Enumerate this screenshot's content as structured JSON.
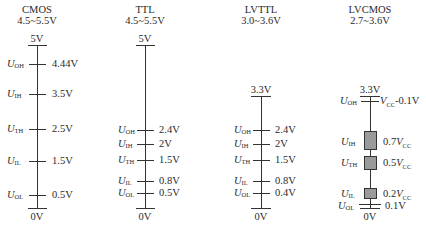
{
  "diagram": {
    "type": "logic-level-comparison",
    "columns": [
      {
        "name": "CMOS",
        "range": "4.5~5.5V",
        "top_label": "5V",
        "bottom_label": "0V",
        "levels": [
          {
            "symbol": "U",
            "sub": "OH",
            "value": "4.44V"
          },
          {
            "symbol": "U",
            "sub": "IH",
            "value": "3.5V"
          },
          {
            "symbol": "U",
            "sub": "TH",
            "value": "2.5V"
          },
          {
            "symbol": "U",
            "sub": "IL",
            "value": "1.5V"
          },
          {
            "symbol": "U",
            "sub": "OL",
            "value": "0.5V"
          }
        ]
      },
      {
        "name": "TTL",
        "range": "4.5~5.5V",
        "top_label": "5V",
        "bottom_label": "0V",
        "levels": [
          {
            "symbol": "U",
            "sub": "OH",
            "value": "2.4V"
          },
          {
            "symbol": "U",
            "sub": "IH",
            "value": "2V"
          },
          {
            "symbol": "U",
            "sub": "TH",
            "value": "1.5V"
          },
          {
            "symbol": "U",
            "sub": "IL",
            "value": "0.8V"
          },
          {
            "symbol": "U",
            "sub": "OL",
            "value": "0.5V"
          }
        ]
      },
      {
        "name": "LVTTL",
        "range": "3.0~3.6V",
        "top_label": "3.3V",
        "bottom_label": "0V",
        "levels": [
          {
            "symbol": "U",
            "sub": "OH",
            "value": "2.4V"
          },
          {
            "symbol": "U",
            "sub": "IH",
            "value": "2V"
          },
          {
            "symbol": "U",
            "sub": "TH",
            "value": "1.5V"
          },
          {
            "symbol": "U",
            "sub": "IL",
            "value": "0.8V"
          },
          {
            "symbol": "U",
            "sub": "OL",
            "value": "0.4V"
          }
        ]
      },
      {
        "name": "LVCMOS",
        "range": "2.7~3.6V",
        "top_label": "3.3V",
        "bottom_label": "0V",
        "levels": [
          {
            "symbol": "U",
            "sub": "OH",
            "value_prefix": "V",
            "value_sub": "CC",
            "value_suffix": "-0.1V"
          },
          {
            "symbol": "U",
            "sub": "IH",
            "value_prefix": "0.7",
            "value_var": "V",
            "value_sub": "CC"
          },
          {
            "symbol": "U",
            "sub": "TH",
            "value_prefix": "0.5",
            "value_var": "V",
            "value_sub": "CC"
          },
          {
            "symbol": "U",
            "sub": "IL",
            "value_prefix": "0.2",
            "value_var": "V",
            "value_sub": "CC"
          },
          {
            "symbol": "U",
            "sub": "OL",
            "value": "0.1V"
          }
        ]
      }
    ],
    "colors": {
      "line": "#333333",
      "box_fill": "#9a9a9a",
      "text": "#2a2a2a"
    }
  }
}
